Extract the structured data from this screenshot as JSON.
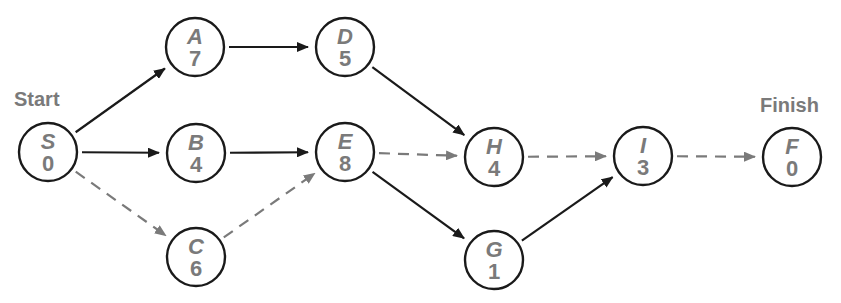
{
  "diagram": {
    "type": "activity-on-node network",
    "colors": {
      "node_stroke": "#1a1a1a",
      "text_gray": "#7a7a7a",
      "solid_edge": "#1a1a1a",
      "dashed_edge": "#7a7a7a"
    },
    "labels": {
      "start": "Start",
      "finish": "Finish"
    },
    "nodes": [
      {
        "id": "S",
        "letter": "S",
        "duration": "0",
        "x": 48,
        "y": 152
      },
      {
        "id": "A",
        "letter": "A",
        "duration": "7",
        "x": 195,
        "y": 47
      },
      {
        "id": "B",
        "letter": "B",
        "duration": "4",
        "x": 196,
        "y": 153
      },
      {
        "id": "C",
        "letter": "C",
        "duration": "6",
        "x": 196,
        "y": 257
      },
      {
        "id": "D",
        "letter": "D",
        "duration": "5",
        "x": 345,
        "y": 47
      },
      {
        "id": "E",
        "letter": "E",
        "duration": "8",
        "x": 345,
        "y": 152
      },
      {
        "id": "H",
        "letter": "H",
        "duration": "4",
        "x": 494,
        "y": 157
      },
      {
        "id": "G",
        "letter": "G",
        "duration": "1",
        "x": 494,
        "y": 260
      },
      {
        "id": "I",
        "letter": "I",
        "duration": "3",
        "x": 643,
        "y": 156
      },
      {
        "id": "F",
        "letter": "F",
        "duration": "0",
        "x": 792,
        "y": 157
      }
    ],
    "edges": [
      {
        "from": "S",
        "to": "A",
        "style": "solid"
      },
      {
        "from": "S",
        "to": "B",
        "style": "solid"
      },
      {
        "from": "S",
        "to": "C",
        "style": "dashed"
      },
      {
        "from": "A",
        "to": "D",
        "style": "solid"
      },
      {
        "from": "B",
        "to": "E",
        "style": "solid"
      },
      {
        "from": "C",
        "to": "E",
        "style": "dashed"
      },
      {
        "from": "D",
        "to": "H",
        "style": "solid"
      },
      {
        "from": "E",
        "to": "H",
        "style": "dashed"
      },
      {
        "from": "E",
        "to": "G",
        "style": "solid"
      },
      {
        "from": "H",
        "to": "I",
        "style": "dashed"
      },
      {
        "from": "G",
        "to": "I",
        "style": "solid"
      },
      {
        "from": "I",
        "to": "F",
        "style": "dashed"
      }
    ]
  }
}
